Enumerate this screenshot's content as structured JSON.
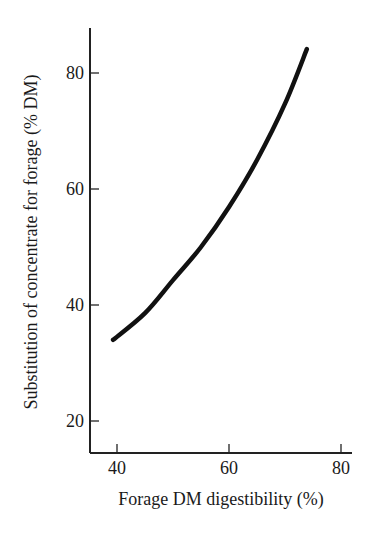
{
  "chart_data": {
    "type": "line",
    "title": "",
    "xlabel": "Forage DM digestibility (%)",
    "ylabel": "Substitution of concentrate for forage (% DM)",
    "xlim": [
      35,
      82
    ],
    "ylim": [
      15,
      88
    ],
    "xticks": [
      40,
      60,
      80
    ],
    "yticks": [
      20,
      40,
      60,
      80
    ],
    "grid": false,
    "legend": null,
    "series": [
      {
        "name": "substitution",
        "color": "#111111",
        "x": [
          39.3,
          45,
          50,
          55,
          60,
          65,
          70,
          73.9
        ],
        "y": [
          34.0,
          38.6,
          44.3,
          50.0,
          56.9,
          65.0,
          74.7,
          84.1
        ]
      }
    ]
  }
}
